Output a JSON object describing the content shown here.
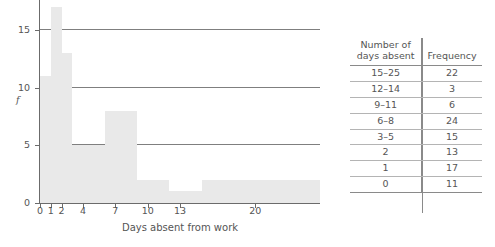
{
  "chart_data": {
    "type": "bar",
    "title": "",
    "xlabel": "Days absent from work",
    "ylabel": "f",
    "xlim": [
      0,
      26
    ],
    "ylim": [
      0,
      17.6
    ],
    "grid": true,
    "gridlines_y": [
      5,
      10,
      15
    ],
    "xticks": [
      0,
      1,
      2,
      4,
      7,
      10,
      13,
      20
    ],
    "xtick_labels": [
      "0",
      "1",
      "2",
      "4",
      "7",
      "10",
      "13",
      "20"
    ],
    "yticks": [
      0,
      5,
      10,
      15
    ],
    "ytick_labels": [
      "0",
      "5",
      "10",
      "15"
    ],
    "bar_color": "#e9e9e9",
    "note": "Histogram with unequal class widths; bar height equals frequency density per class as drawn.",
    "bins": [
      {
        "label": "0",
        "x_start": 0,
        "x_end": 1,
        "frequency": 11,
        "height": 11
      },
      {
        "label": "1",
        "x_start": 1,
        "x_end": 2,
        "frequency": 17,
        "height": 17
      },
      {
        "label": "2",
        "x_start": 2,
        "x_end": 3,
        "frequency": 13,
        "height": 13
      },
      {
        "label": "3-5",
        "x_start": 3,
        "x_end": 6,
        "frequency": 15,
        "height": 5
      },
      {
        "label": "6-8",
        "x_start": 6,
        "x_end": 9,
        "frequency": 24,
        "height": 8
      },
      {
        "label": "9-11",
        "x_start": 9,
        "x_end": 12,
        "frequency": 6,
        "height": 2
      },
      {
        "label": "12-14",
        "x_start": 12,
        "x_end": 15,
        "frequency": 3,
        "height": 1
      },
      {
        "label": "15-25",
        "x_start": 15,
        "x_end": 26,
        "frequency": 22,
        "height": 2
      }
    ],
    "categories": [
      "0",
      "1",
      "2",
      "3-5",
      "6-8",
      "9-11",
      "12-14",
      "15-25"
    ],
    "values": [
      11,
      17,
      13,
      15,
      24,
      6,
      3,
      22
    ]
  },
  "table": {
    "headers": {
      "col1_line1": "Number of",
      "col1_line2": "days absent",
      "col2": "Frequency"
    },
    "rows": [
      {
        "range": "15–25",
        "frequency": "22"
      },
      {
        "range": "12–14",
        "frequency": "3"
      },
      {
        "range": "9–11",
        "frequency": "6"
      },
      {
        "range": "6–8",
        "frequency": "24"
      },
      {
        "range": "3–5",
        "frequency": "15"
      },
      {
        "range": "2",
        "frequency": "13"
      },
      {
        "range": "1",
        "frequency": "17"
      },
      {
        "range": "0",
        "frequency": "11"
      }
    ]
  }
}
